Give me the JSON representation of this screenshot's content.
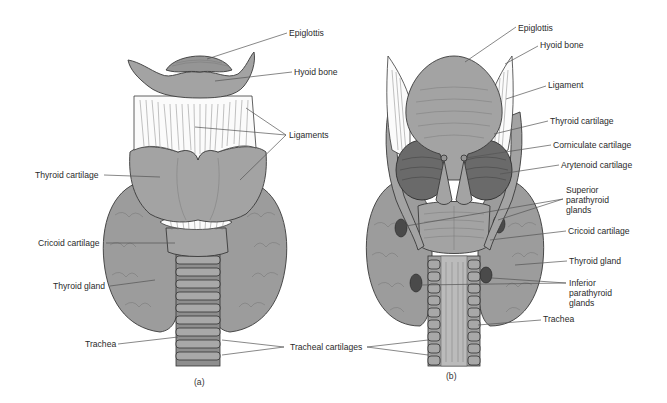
{
  "figure": {
    "panels": [
      {
        "id": "a",
        "caption": "(a)",
        "view": "anterior",
        "labels": {
          "epiglottis": "Epiglottis",
          "hyoid_bone": "Hyoid bone",
          "ligaments": "Ligaments",
          "thyroid_cartilage": "Thyroid cartilage",
          "cricoid_cartilage": "Cricoid cartilage",
          "thyroid_gland": "Thyroid gland",
          "trachea": "Trachea"
        }
      },
      {
        "id": "b",
        "caption": "(b)",
        "view": "posterior",
        "labels": {
          "epiglottis": "Epiglottis",
          "hyoid_bone": "Hyoid bone",
          "ligament": "Ligament",
          "thyroid_cartilage": "Thyroid cartilage",
          "corniculate_cartilage": "Corniculate cartilage",
          "arytenoid_cartilage": "Arytenoid cartilage",
          "superior_parathyroid_1": "Superior",
          "superior_parathyroid_2": "parathyroid",
          "superior_parathyroid_3": "glands",
          "cricoid_cartilage": "Cricoid cartilage",
          "thyroid_gland": "Thyroid gland",
          "inferior_parathyroid_1": "Inferior",
          "inferior_parathyroid_2": "parathyroid",
          "inferior_parathyroid_3": "glands",
          "trachea": "Trachea"
        }
      }
    ],
    "shared_labels": {
      "tracheal_cartilages": "Tracheal cartilages"
    },
    "colors": {
      "cartilage_gray": "#a3a3a3",
      "ligament_white": "#fbfbfb",
      "outline": "#3a3a3a",
      "parathyroid_dark": "#4a4a4a"
    }
  }
}
